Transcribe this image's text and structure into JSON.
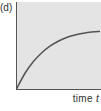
{
  "panel": {
    "label": "(d)"
  },
  "axes": {
    "xlabel_text": "time ",
    "xlabel_var": "t"
  },
  "colors": {
    "plot_background": "#e4e4e4",
    "axis": "#555555",
    "curve": "#555555"
  },
  "chart_data": {
    "type": "line",
    "title": "(d)",
    "xlabel": "time t",
    "ylabel": "",
    "grid": false,
    "legend": null,
    "x": [
      0,
      0.1,
      0.2,
      0.3,
      0.4,
      0.5,
      0.6,
      0.7,
      0.8,
      0.9,
      1.0
    ],
    "series": [
      {
        "name": "curve",
        "values": [
          0.0,
          0.25,
          0.44,
          0.58,
          0.69,
          0.77,
          0.83,
          0.87,
          0.9,
          0.92,
          0.93
        ]
      }
    ],
    "xlim": [
      0,
      1
    ],
    "ylim": [
      0,
      1.0
    ],
    "tick_labels": []
  }
}
